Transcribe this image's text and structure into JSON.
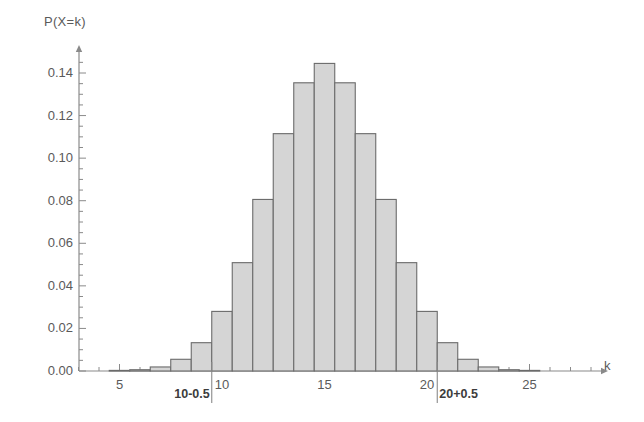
{
  "chart_data": {
    "type": "bar",
    "title": "",
    "subtitle": "",
    "xlabel": "k",
    "ylabel": "P(X=k)",
    "xlim": [
      2,
      29.5
    ],
    "ylim": [
      0.0,
      0.152
    ],
    "grid": false,
    "legend": null,
    "bar_fill_color": "#d5d5d5",
    "bar_edge_color": "#6b6b6b",
    "axis_color": "#8a8a8a",
    "categories": [
      3,
      4,
      5,
      6,
      7,
      8,
      9,
      10,
      11,
      12,
      13,
      14,
      15,
      16,
      17,
      18,
      19,
      20,
      21,
      22,
      23,
      24,
      25,
      26,
      27
    ],
    "values": [
      0.0,
      0.0,
      0.0001,
      0.0006,
      0.0019,
      0.0055,
      0.0133,
      0.028,
      0.0509,
      0.0806,
      0.1115,
      0.1354,
      0.1445,
      0.1354,
      0.1115,
      0.0806,
      0.0509,
      0.028,
      0.0133,
      0.0055,
      0.0019,
      0.0006,
      0.0001,
      0.0,
      0.0
    ],
    "xticks": [
      5,
      10,
      15,
      20,
      25
    ],
    "xtick_labels": [
      "5",
      "10",
      "15",
      "20",
      "25"
    ],
    "yticks": [
      0.0,
      0.02,
      0.04,
      0.06,
      0.08,
      0.1,
      0.12,
      0.14
    ],
    "ytick_labels": [
      "0.00",
      "0.02",
      "0.04",
      "0.06",
      "0.08",
      "0.10",
      "0.12",
      "0.14"
    ],
    "y_minor_step": 0.005,
    "x_minor_step": 1,
    "annotations": [
      {
        "name": "lower-continuity-marker",
        "label": "10-0.5",
        "x": 9.5,
        "kind": "vertical-line"
      },
      {
        "name": "upper-continuity-marker",
        "label": "20+0.5",
        "x": 20.5,
        "kind": "vertical-line"
      }
    ]
  }
}
